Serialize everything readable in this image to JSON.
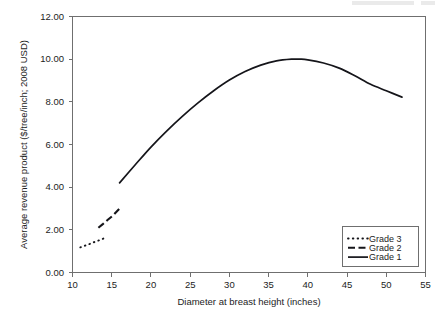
{
  "figure": {
    "background_color": "#ffffff",
    "ink_color": "#15151a",
    "frame_color": "#6f6f6f"
  },
  "chart_data": {
    "type": "line",
    "title": "",
    "xlabel": "Diameter at breast height (inches)",
    "ylabel": "Average revenue product ($/tree/inch; 2008 USD)",
    "xlim": [
      10,
      55
    ],
    "ylim": [
      0.0,
      12.0
    ],
    "xticks": [
      10,
      15,
      20,
      25,
      30,
      35,
      40,
      45,
      50,
      55
    ],
    "xtick_labels": [
      "10",
      "15",
      "20",
      "25",
      "30",
      "35",
      "40",
      "45",
      "50",
      "55"
    ],
    "yticks": [
      0.0,
      2.0,
      4.0,
      6.0,
      8.0,
      10.0,
      12.0
    ],
    "ytick_labels": [
      "0.00",
      "2.00",
      "4.00",
      "6.00",
      "8.00",
      "10.00",
      "12.00"
    ],
    "grid": false,
    "legend_position": "lower right",
    "series": [
      {
        "name": "Grade 3",
        "style": "dotted",
        "x": [
          11.0,
          11.6,
          12.2,
          12.8,
          13.4,
          14.0
        ],
        "values": [
          1.18,
          1.26,
          1.34,
          1.43,
          1.51,
          1.6
        ]
      },
      {
        "name": "Grade 2",
        "style": "dashed",
        "x": [
          13.3,
          13.9,
          14.5,
          15.1,
          15.7,
          16.0
        ],
        "values": [
          2.1,
          2.28,
          2.47,
          2.65,
          2.88,
          3.0
        ]
      },
      {
        "name": "Grade 1",
        "style": "solid",
        "x": [
          16.0,
          18.0,
          20.0,
          22.0,
          24.0,
          26.0,
          28.0,
          30.0,
          32.0,
          34.0,
          36.0,
          38.0,
          39.0,
          40.0,
          42.0,
          44.0,
          46.0,
          48.0,
          50.0,
          52.0
        ],
        "values": [
          4.2,
          5.05,
          5.88,
          6.63,
          7.32,
          7.95,
          8.52,
          9.02,
          9.42,
          9.72,
          9.92,
          10.0,
          10.0,
          9.97,
          9.82,
          9.58,
          9.22,
          8.82,
          8.52,
          8.22
        ]
      }
    ],
    "legend_entries": [
      {
        "label": "Grade 3",
        "style": "dotted"
      },
      {
        "label": "Grade 2",
        "style": "dashed"
      },
      {
        "label": "Grade 1",
        "style": "solid"
      }
    ]
  }
}
